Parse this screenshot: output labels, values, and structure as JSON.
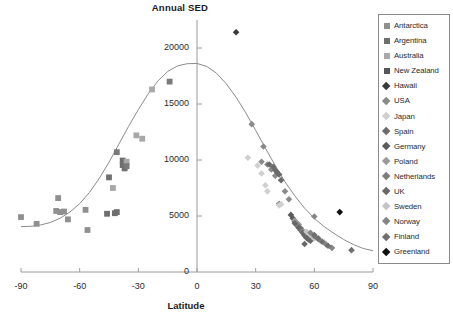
{
  "chart_data": {
    "type": "scatter",
    "title": "Annual SED",
    "xlabel": "Latitude",
    "ylabel": "",
    "xlim": [
      -90,
      90
    ],
    "ylim": [
      0,
      22500
    ],
    "xticks": [
      -90,
      -60,
      -30,
      0,
      30,
      60,
      90
    ],
    "yticks": [
      0,
      5000,
      10000,
      15000,
      20000
    ],
    "grid": false,
    "legend_position": "right-outside",
    "trendline": {
      "name": "fitted gaussian trend",
      "description": "Bell-shaped curve peaking at latitude 0 near 18600 SED, flattening to about 4000 at -90 and about 1900 at 90",
      "points": [
        [
          -90,
          4050
        ],
        [
          -85,
          4080
        ],
        [
          -80,
          4200
        ],
        [
          -75,
          4420
        ],
        [
          -70,
          4800
        ],
        [
          -65,
          5350
        ],
        [
          -60,
          6100
        ],
        [
          -55,
          7100
        ],
        [
          -50,
          8350
        ],
        [
          -45,
          9800
        ],
        [
          -40,
          11400
        ],
        [
          -35,
          13000
        ],
        [
          -30,
          14500
        ],
        [
          -25,
          15900
        ],
        [
          -20,
          17050
        ],
        [
          -15,
          17900
        ],
        [
          -10,
          18400
        ],
        [
          -5,
          18600
        ],
        [
          0,
          18620
        ],
        [
          5,
          18350
        ],
        [
          10,
          17750
        ],
        [
          15,
          16800
        ],
        [
          20,
          15600
        ],
        [
          25,
          14200
        ],
        [
          30,
          12650
        ],
        [
          35,
          11050
        ],
        [
          40,
          9500
        ],
        [
          45,
          8050
        ],
        [
          50,
          6800
        ],
        [
          55,
          5700
        ],
        [
          60,
          4800
        ],
        [
          65,
          4050
        ],
        [
          70,
          3450
        ],
        [
          75,
          2900
        ],
        [
          80,
          2450
        ],
        [
          85,
          2100
        ],
        [
          90,
          1900
        ]
      ]
    },
    "series": [
      {
        "name": "Antarctica",
        "marker": "square",
        "color": "#8f8f8f",
        "points": [
          [
            -90,
            4900
          ],
          [
            -82,
            4300
          ],
          [
            -72,
            5450
          ],
          [
            -71,
            6600
          ],
          [
            -70,
            5350
          ],
          [
            -68,
            5400
          ],
          [
            -66,
            4700
          ],
          [
            -57,
            5550
          ],
          [
            -56,
            3750
          ]
        ]
      },
      {
        "name": "Argentina",
        "marker": "square",
        "color": "#6e6e6e",
        "points": [
          [
            -45,
            8450
          ],
          [
            -46,
            5200
          ],
          [
            -42,
            5250
          ],
          [
            -41,
            5350
          ],
          [
            -38,
            9950
          ],
          [
            -37,
            9250
          ],
          [
            -38,
            9550
          ]
        ]
      },
      {
        "name": "Australia",
        "marker": "square",
        "color": "#a8a8a8",
        "points": [
          [
            -31,
            12200
          ],
          [
            -28,
            11900
          ],
          [
            -23,
            16300
          ],
          [
            -43,
            7500
          ],
          [
            -36,
            9850
          ]
        ]
      },
      {
        "name": "New Zealand",
        "marker": "square",
        "color": "#7a7a7a",
        "points": [
          [
            -41,
            10700
          ],
          [
            -36,
            9450
          ],
          [
            -14,
            17000
          ]
        ]
      },
      {
        "name": "Hawaii",
        "marker": "diamond",
        "color": "#3a3a3a",
        "points": [
          [
            20,
            21400
          ]
        ]
      },
      {
        "name": "USA",
        "marker": "diamond",
        "color": "#8a8a8a",
        "points": [
          [
            28,
            13200
          ],
          [
            34,
            11200
          ],
          [
            33,
            9850
          ],
          [
            36,
            9600
          ],
          [
            38,
            9150
          ],
          [
            40,
            8600
          ],
          [
            42,
            6100
          ],
          [
            47,
            6500
          ],
          [
            45,
            7200
          ]
        ]
      },
      {
        "name": "Japan",
        "marker": "diamond",
        "color": "#cfcfcf",
        "points": [
          [
            26,
            10200
          ],
          [
            31,
            9500
          ],
          [
            33,
            8800
          ],
          [
            35,
            7750
          ],
          [
            36,
            7200
          ],
          [
            43,
            6050
          ],
          [
            42,
            5950
          ]
        ]
      },
      {
        "name": "Spain",
        "marker": "diamond",
        "color": "#6b6b6b",
        "points": [
          [
            37,
            9600
          ],
          [
            39,
            9400
          ],
          [
            40,
            9100
          ],
          [
            41,
            8900
          ],
          [
            42,
            8700
          ],
          [
            43,
            8200
          ]
        ]
      },
      {
        "name": "Germany",
        "marker": "diamond",
        "color": "#5c5c5c",
        "points": [
          [
            48,
            5100
          ],
          [
            49,
            4800
          ],
          [
            50,
            4500
          ],
          [
            51,
            4300
          ],
          [
            52,
            4000
          ],
          [
            53,
            3750
          ],
          [
            54,
            3600
          ]
        ]
      },
      {
        "name": "Poland",
        "marker": "diamond",
        "color": "#9a9a9a",
        "points": [
          [
            50,
            4600
          ],
          [
            51,
            4400
          ],
          [
            52,
            4250
          ],
          [
            53,
            3900
          ],
          [
            54,
            3700
          ]
        ]
      },
      {
        "name": "Netherlands",
        "marker": "diamond",
        "color": "#7d7d7d",
        "points": [
          [
            51,
            4200
          ],
          [
            52,
            4050
          ],
          [
            53,
            3900
          ]
        ]
      },
      {
        "name": "UK",
        "marker": "diamond",
        "color": "#686868",
        "points": [
          [
            50,
            4350
          ],
          [
            52,
            3950
          ],
          [
            54,
            3500
          ],
          [
            55,
            3250
          ],
          [
            56,
            3050
          ],
          [
            57,
            2900
          ],
          [
            58,
            2800
          ],
          [
            55,
            2500
          ]
        ]
      },
      {
        "name": "Sweden",
        "marker": "diamond",
        "color": "#c4c4c4",
        "points": [
          [
            56,
            3600
          ],
          [
            58,
            3350
          ],
          [
            59,
            3150
          ],
          [
            60,
            3000
          ],
          [
            63,
            2800
          ],
          [
            65,
            2650
          ]
        ]
      },
      {
        "name": "Norway",
        "marker": "diamond",
        "color": "#858585",
        "points": [
          [
            58,
            3500
          ],
          [
            60,
            3200
          ],
          [
            62,
            2950
          ],
          [
            66,
            2450
          ],
          [
            69,
            2150
          ],
          [
            60,
            4950
          ]
        ]
      },
      {
        "name": "Finland",
        "marker": "diamond",
        "color": "#6f6f6f",
        "points": [
          [
            60,
            3300
          ],
          [
            62,
            3000
          ],
          [
            64,
            2700
          ],
          [
            67,
            2350
          ],
          [
            79,
            1950
          ]
        ]
      },
      {
        "name": "Greenland",
        "marker": "diamond",
        "color": "#111111",
        "points": [
          [
            73,
            5350
          ]
        ]
      }
    ]
  },
  "legend": {
    "entries": [
      {
        "label": "Antarctica",
        "marker": "square",
        "color": "#8f8f8f"
      },
      {
        "label": "Argentina",
        "marker": "square",
        "color": "#6e6e6e"
      },
      {
        "label": "Australia",
        "marker": "square",
        "color": "#a8a8a8"
      },
      {
        "label": "New Zealand",
        "marker": "square",
        "color": "#565656"
      },
      {
        "label": "Hawaii",
        "marker": "diamond",
        "color": "#3a3a3a"
      },
      {
        "label": "USA",
        "marker": "diamond",
        "color": "#8a8a8a"
      },
      {
        "label": "Japan",
        "marker": "diamond",
        "color": "#cfcfcf"
      },
      {
        "label": "Spain",
        "marker": "diamond",
        "color": "#6b6b6b"
      },
      {
        "label": "Germany",
        "marker": "diamond",
        "color": "#5c5c5c"
      },
      {
        "label": "Poland",
        "marker": "diamond",
        "color": "#9a9a9a"
      },
      {
        "label": "Netherlands",
        "marker": "diamond",
        "color": "#7d7d7d"
      },
      {
        "label": "UK",
        "marker": "diamond",
        "color": "#686868"
      },
      {
        "label": "Sweden",
        "marker": "diamond",
        "color": "#c4c4c4"
      },
      {
        "label": "Norway",
        "marker": "diamond",
        "color": "#858585"
      },
      {
        "label": "Finland",
        "marker": "diamond",
        "color": "#6f6f6f"
      },
      {
        "label": "Greenland",
        "marker": "diamond",
        "color": "#111111"
      }
    ]
  },
  "colors": {
    "axis": "#9a9a9a",
    "text": "#2b2b2b",
    "trendline": "#8c8c8c",
    "background": "#ffffff"
  }
}
